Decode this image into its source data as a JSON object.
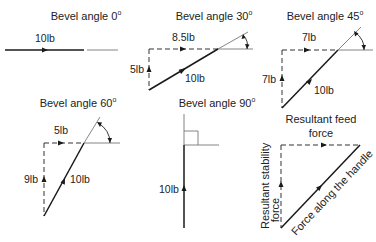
{
  "panels": [
    {
      "title": "Bevel angle 0",
      "degree_symbol": "o",
      "forces": {
        "handle": "10lb"
      }
    },
    {
      "title": "Bevel angle 30",
      "degree_symbol": "o",
      "forces": {
        "feed": "8.5lb",
        "stability": "5lb",
        "handle": "10lb"
      }
    },
    {
      "title": "Bevel angle 45",
      "degree_symbol": "o",
      "forces": {
        "feed": "7lb",
        "stability": "7lb",
        "handle": "10lb"
      }
    },
    {
      "title": "Bevel angle 60",
      "degree_symbol": "o",
      "forces": {
        "feed": "5lb",
        "stability": "9lb",
        "handle": "10lb"
      }
    },
    {
      "title": "Bevel angle 90",
      "degree_symbol": "o",
      "forces": {
        "handle": "10lb"
      }
    }
  ],
  "legend": {
    "feed_line1": "Resultant feed",
    "feed_line2": "force",
    "stability_line1": "Resultant stability",
    "stability_line2": "force",
    "handle": "Force along the handle"
  },
  "colors": {
    "ink": "#1a1a1a",
    "reference_line": "#777777"
  }
}
